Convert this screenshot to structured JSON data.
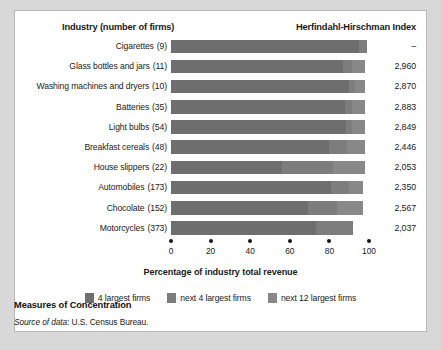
{
  "header": {
    "industry_label": "Industry (number of firms)",
    "hhi_label": "Herfindahl-Hirschman Index"
  },
  "axis": {
    "title": "Percentage of industry total revenue",
    "ticks": [
      "0",
      "20",
      "40",
      "60",
      "80",
      "100"
    ],
    "min": 0,
    "max": 100
  },
  "legend": [
    {
      "label": "4 largest firms",
      "color": "#6e6e6e"
    },
    {
      "label": "next 4 largest firms",
      "color": "#7d7d7d"
    },
    {
      "label": "next 12 largest firms",
      "color": "#888888"
    }
  ],
  "caption": {
    "title": "Measures of Concentration",
    "source_lead": "Source of data",
    "source_rest": ": U.S. Census Bureau."
  },
  "chart_data": {
    "type": "bar",
    "orientation": "horizontal",
    "stacked": true,
    "title": "Measures of Concentration",
    "xlabel": "Percentage of industry total revenue",
    "ylabel": "Industry (number of firms)",
    "xlim": [
      0,
      100
    ],
    "xticks": [
      0,
      20,
      40,
      60,
      80,
      100
    ],
    "grid": false,
    "legend_position": "bottom",
    "categories": [
      "Cigarettes",
      "Glass bottles and jars",
      "Washing machines and dryers",
      "Batteries",
      "Light bulbs",
      "Breakfast cereals",
      "House slippers",
      "Automobiles",
      "Chocolate",
      "Motorcycles"
    ],
    "firm_counts": [
      "(9)",
      "(11)",
      "(10)",
      "(35)",
      "(54)",
      "(48)",
      "(22)",
      "(173)",
      "(152)",
      "(373)"
    ],
    "hhi_values": [
      "–",
      "2,960",
      "2,870",
      "2,883",
      "2,849",
      "2,446",
      "2,053",
      "2,350",
      "2,567",
      "2,037"
    ],
    "series": [
      {
        "name": "4 largest firms",
        "color": "#6e6e6e",
        "values": [
          95.0,
          87.0,
          90.0,
          88.0,
          88.5,
          80.0,
          56.0,
          81.0,
          69.0,
          73.0
        ]
      },
      {
        "name": "next 4 largest firms",
        "color": "#7d7d7d",
        "values": [
          4.0,
          4.5,
          3.0,
          3.5,
          3.0,
          9.0,
          26.0,
          9.0,
          15.0,
          19.0
        ]
      },
      {
        "name": "next 12 largest firms",
        "color": "#888888",
        "values": [
          0.0,
          6.5,
          5.0,
          6.5,
          6.5,
          9.0,
          16.0,
          7.0,
          13.0,
          0.0
        ]
      }
    ],
    "rows": [
      {
        "category": "Cigarettes",
        "firms": "(9)",
        "hhi": "–",
        "segments": [
          95.0,
          4.0,
          0.0
        ],
        "total": 99.0
      },
      {
        "category": "Glass bottles and jars",
        "firms": "(11)",
        "hhi": "2,960",
        "segments": [
          87.0,
          4.5,
          6.5
        ],
        "total": 98.0
      },
      {
        "category": "Washing machines and dryers",
        "firms": "(10)",
        "hhi": "2,870",
        "segments": [
          90.0,
          3.0,
          5.0
        ],
        "total": 98.0
      },
      {
        "category": "Batteries",
        "firms": "(35)",
        "hhi": "2,883",
        "segments": [
          88.0,
          3.5,
          6.5
        ],
        "total": 98.0
      },
      {
        "category": "Light bulbs",
        "firms": "(54)",
        "hhi": "2,849",
        "segments": [
          88.5,
          3.0,
          6.5
        ],
        "total": 98.0
      },
      {
        "category": "Breakfast cereals",
        "firms": "(48)",
        "hhi": "2,446",
        "segments": [
          80.0,
          9.0,
          9.0
        ],
        "total": 98.0
      },
      {
        "category": "House slippers",
        "firms": "(22)",
        "hhi": "2,053",
        "segments": [
          56.0,
          26.0,
          16.0
        ],
        "total": 98.0
      },
      {
        "category": "Automobiles",
        "firms": "(173)",
        "hhi": "2,350",
        "segments": [
          81.0,
          9.0,
          7.0
        ],
        "total": 97.0
      },
      {
        "category": "Chocolate",
        "firms": "(152)",
        "hhi": "2,567",
        "segments": [
          69.0,
          15.0,
          13.0
        ],
        "total": 97.0
      },
      {
        "category": "Motorcycles",
        "firms": "(373)",
        "hhi": "2,037",
        "segments": [
          73.0,
          19.0,
          0.0
        ],
        "total": 92.0
      }
    ]
  }
}
